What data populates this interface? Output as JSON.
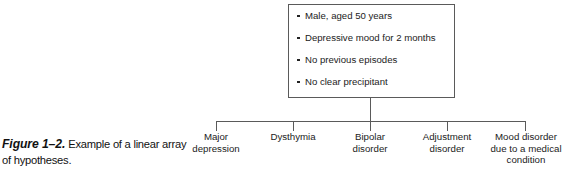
{
  "figure": {
    "caption_label": "Figure 1–2.",
    "caption_text": "Example of a linear array of hypotheses."
  },
  "case_box": {
    "bullets": [
      "Male, aged 50 years",
      "Depressive mood for 2 months",
      "No previous episodes",
      "No clear precipitant"
    ]
  },
  "hypotheses": [
    {
      "line1": "Major",
      "line2": "depression",
      "line3": ""
    },
    {
      "line1": "Dysthymia",
      "line2": "",
      "line3": ""
    },
    {
      "line1": "Bipolar",
      "line2": "disorder",
      "line3": ""
    },
    {
      "line1": "Adjustment",
      "line2": "disorder",
      "line3": ""
    },
    {
      "line1": "Mood disorder",
      "line2": "due to a medical",
      "line3": "condition"
    }
  ],
  "colors": {
    "line": "#5a5a5a",
    "text": "#1b1b1b",
    "background": "#ffffff"
  }
}
